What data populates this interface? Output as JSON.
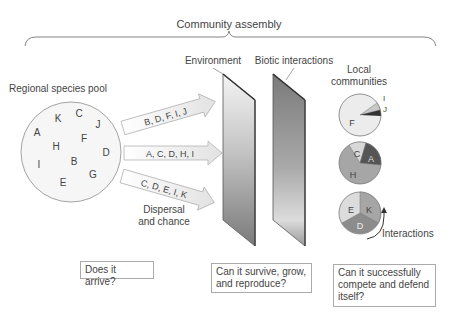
{
  "title": "Community assembly",
  "labels": {
    "environment": "Environment",
    "biotic": "Biotic interactions",
    "pool": "Regional species pool",
    "local": [
      "Local",
      "communities"
    ],
    "dispersal": [
      "Dispersal",
      "and chance"
    ],
    "interactions": "Interactions"
  },
  "pool_species": [
    {
      "l": "K",
      "x": 58,
      "y": 122
    },
    {
      "l": "C",
      "x": 79,
      "y": 117
    },
    {
      "l": "J",
      "x": 98,
      "y": 128
    },
    {
      "l": "A",
      "x": 37,
      "y": 136
    },
    {
      "l": "F",
      "x": 84,
      "y": 142
    },
    {
      "l": "H",
      "x": 56,
      "y": 150
    },
    {
      "l": "D",
      "x": 106,
      "y": 156
    },
    {
      "l": "I",
      "x": 39,
      "y": 168
    },
    {
      "l": "B",
      "x": 74,
      "y": 165
    },
    {
      "l": "G",
      "x": 93,
      "y": 178
    },
    {
      "l": "E",
      "x": 63,
      "y": 186
    }
  ],
  "arrows": [
    "B, D, F, I, J",
    "A, C, D, H, I",
    "C, D, E, I, K"
  ],
  "communities": [
    {
      "slices": [
        {
          "l": "F",
          "color": "#ececec"
        },
        {
          "l": "I",
          "color": "#c8c8c8"
        },
        {
          "l": "J",
          "color": "#333333"
        }
      ]
    },
    {
      "slices": [
        {
          "l": "C",
          "color": "#d8d8d8"
        },
        {
          "l": "A",
          "color": "#555555"
        },
        {
          "l": "H",
          "color": "#a6a6a6"
        }
      ]
    },
    {
      "slices": [
        {
          "l": "E",
          "color": "#dcdcdc"
        },
        {
          "l": "K",
          "color": "#a6a6a6"
        },
        {
          "l": "D",
          "color": "#8c8c8c"
        }
      ]
    }
  ],
  "questions": {
    "arrive": "Does it arrive?",
    "survive": "Can it survive, grow, and reproduce?",
    "compete": "Can it successfully compete and defend itself?"
  }
}
